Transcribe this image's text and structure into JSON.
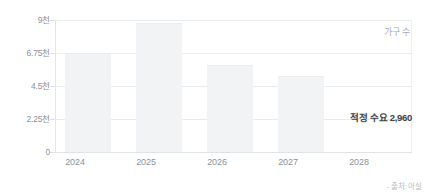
{
  "chart_data": {
    "type": "bar",
    "title": "",
    "subtitle": "",
    "xlabel": "",
    "ylabel": "가구 수",
    "categories": [
      "2024",
      "2025",
      "2026",
      "2027",
      "2028"
    ],
    "values": [
      6750,
      8800,
      5900,
      5150,
      0
    ],
    "ylim": [
      0,
      9000
    ],
    "yticks": [
      0,
      2250,
      4500,
      6750,
      9000
    ],
    "ytick_labels": [
      "0",
      "2.25천",
      "4.5천",
      "6.75천",
      "9천"
    ],
    "grid": true,
    "legend": false,
    "legend_position": "none",
    "series": [
      {
        "name": "가구 수",
        "values": [
          6750,
          8800,
          5900,
          5150,
          0
        ],
        "color": "#f2f3f4"
      }
    ],
    "annotations": [
      {
        "name": "optimal-demand",
        "text": "적정 수요 2,960",
        "value": 2960
      },
      {
        "name": "unit-label",
        "text": "가구 수"
      }
    ],
    "source_note": "- 출처: 아실",
    "colors": {
      "bar": "#f2f3f4",
      "grid": "#e9ecef",
      "axis": "#dfe3e6",
      "tick_text": "#8a9099",
      "annotation_text": "#3d4146",
      "source_text": "#b7bcc2",
      "background": "#ffffff"
    }
  }
}
